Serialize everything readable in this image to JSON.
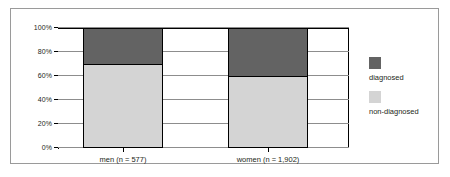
{
  "chart_data": {
    "type": "bar",
    "subtype": "stacked-100-percent",
    "title": "",
    "subtitle": "",
    "xlabel": "",
    "ylabel": "",
    "categories": [
      "men (n = 577)",
      "women (n = 1,902)"
    ],
    "series": [
      {
        "name": "non-diagnosed",
        "values": [
          70,
          60
        ],
        "color": "#d4d4d4"
      },
      {
        "name": "diagnosed",
        "values": [
          30,
          40
        ],
        "color": "#636363"
      }
    ],
    "stack_order_bottom_to_top": [
      "non-diagnosed",
      "diagnosed"
    ],
    "ylim": [
      0,
      100
    ],
    "yticks": [
      0,
      20,
      40,
      60,
      80,
      100
    ],
    "ytick_labels": [
      "0%",
      "20%",
      "40%",
      "60%",
      "80%",
      "100%"
    ],
    "grid": true,
    "grid_axis": "y",
    "legend": true,
    "legend_position": "right",
    "legend_entries": [
      "diagnosed",
      "non-diagnosed"
    ],
    "annotations": [],
    "colors": {
      "diagnosed": "#636363",
      "non_diagnosed": "#d4d4d4",
      "axis": "#000000",
      "gridline": "#8d8d8d",
      "frame": "#9a9a9a",
      "text": "#231f20",
      "background": "#ffffff"
    }
  }
}
